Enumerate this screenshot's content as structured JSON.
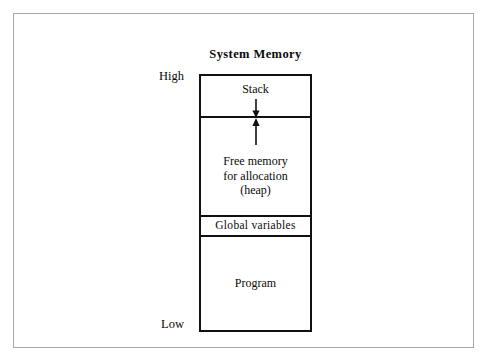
{
  "figure": {
    "title": "System Memory",
    "scale": {
      "high_label": "High",
      "low_label": "Low"
    },
    "frame_color": "#a8a8a8",
    "box_color": "#111111",
    "background_color": "#ffffff"
  },
  "memory_map": {
    "segments": [
      {
        "id": "stack",
        "label": "Stack",
        "lines": [
          "Stack"
        ],
        "arrow": "down-arrow-icon",
        "arrow_meaning": "stack grows downward"
      },
      {
        "id": "heap",
        "label": "Free memory for allocation (heap)",
        "lines": [
          "Free memory",
          "for allocation",
          "(heap)"
        ],
        "arrow": "up-arrow-icon",
        "arrow_meaning": "heap grows upward"
      },
      {
        "id": "globals",
        "label": "Global variables",
        "lines": [
          "Global variables"
        ],
        "arrow": null,
        "arrow_meaning": null
      },
      {
        "id": "program",
        "label": "Program",
        "lines": [
          "Program"
        ],
        "arrow": null,
        "arrow_meaning": null
      }
    ]
  }
}
